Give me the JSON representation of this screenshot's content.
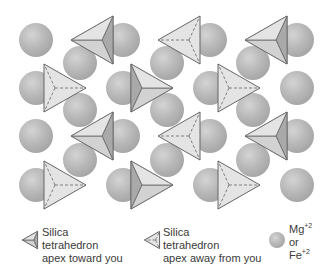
{
  "figure": {
    "colors": {
      "sphere_fill": "#b3b3b3",
      "sphere_highlight": "#d6d6d6",
      "tetra_face_light": "#e4e4e4",
      "tetra_face_mid": "#d2d2d2",
      "tetra_face_dark": "#a9a9a9",
      "edge": "#666666",
      "text": "#3a3a3a"
    },
    "spheres": [
      {
        "x": 36,
        "y": 40
      },
      {
        "x": 123,
        "y": 40
      },
      {
        "x": 210,
        "y": 40
      },
      {
        "x": 297,
        "y": 40
      },
      {
        "x": 80,
        "y": 63
      },
      {
        "x": 167,
        "y": 63
      },
      {
        "x": 253,
        "y": 63
      },
      {
        "x": 36,
        "y": 88
      },
      {
        "x": 123,
        "y": 88
      },
      {
        "x": 210,
        "y": 88
      },
      {
        "x": 297,
        "y": 88
      },
      {
        "x": 80,
        "y": 110
      },
      {
        "x": 167,
        "y": 110
      },
      {
        "x": 253,
        "y": 110
      },
      {
        "x": 36,
        "y": 136
      },
      {
        "x": 123,
        "y": 136
      },
      {
        "x": 210,
        "y": 136
      },
      {
        "x": 297,
        "y": 136
      },
      {
        "x": 80,
        "y": 160
      },
      {
        "x": 167,
        "y": 160
      },
      {
        "x": 253,
        "y": 160
      },
      {
        "x": 36,
        "y": 185
      },
      {
        "x": 123,
        "y": 185
      },
      {
        "x": 210,
        "y": 185
      },
      {
        "x": 297,
        "y": 185
      }
    ],
    "tetrahedra": [
      {
        "cx": 92,
        "cy": 40,
        "dir": "left",
        "apex": "toward"
      },
      {
        "cx": 179,
        "cy": 40,
        "dir": "left",
        "apex": "away"
      },
      {
        "cx": 266,
        "cy": 40,
        "dir": "left",
        "apex": "toward"
      },
      {
        "cx": 65,
        "cy": 88,
        "dir": "right",
        "apex": "away"
      },
      {
        "cx": 152,
        "cy": 88,
        "dir": "right",
        "apex": "toward"
      },
      {
        "cx": 239,
        "cy": 88,
        "dir": "right",
        "apex": "away"
      },
      {
        "cx": 92,
        "cy": 136,
        "dir": "left",
        "apex": "toward"
      },
      {
        "cx": 179,
        "cy": 136,
        "dir": "left",
        "apex": "away"
      },
      {
        "cx": 266,
        "cy": 136,
        "dir": "left",
        "apex": "toward"
      },
      {
        "cx": 65,
        "cy": 185,
        "dir": "right",
        "apex": "away"
      },
      {
        "cx": 152,
        "cy": 185,
        "dir": "right",
        "apex": "toward"
      },
      {
        "cx": 239,
        "cy": 185,
        "dir": "right",
        "apex": "away"
      }
    ]
  },
  "legend": {
    "toward": {
      "line1": "Silica",
      "line2": "tetrahedron",
      "line3": "apex toward you"
    },
    "away": {
      "line1": "Silica",
      "line2": "tetrahedron",
      "line3": "apex away from you"
    },
    "cation": {
      "line1_base": "Mg",
      "line1_sup": "+2",
      "line2": "or",
      "line3_base": "Fe",
      "line3_sup": "+2"
    }
  }
}
